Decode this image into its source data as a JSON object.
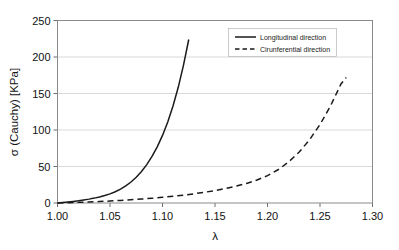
{
  "chart_data": {
    "type": "line",
    "title": "",
    "xlabel": "λ",
    "ylabel": "σ (Cauchy) [KPa]",
    "xlim": [
      1.0,
      1.3
    ],
    "ylim": [
      0,
      250
    ],
    "xticks": [
      "1.00",
      "1.05",
      "1.10",
      "1.15",
      "1.20",
      "1.25",
      "1.30"
    ],
    "xtick_values": [
      1.0,
      1.05,
      1.1,
      1.15,
      1.2,
      1.25,
      1.3
    ],
    "yticks": [
      "0",
      "50",
      "100",
      "150",
      "200",
      "250"
    ],
    "ytick_values": [
      0,
      50,
      100,
      150,
      200,
      250
    ],
    "grid": "horizontal",
    "legend_position": "upper-center-right",
    "series": [
      {
        "name": "Longitudinal direction",
        "style": "solid",
        "color": "#1a1a1a",
        "x": [
          1.0,
          1.005,
          1.01,
          1.015,
          1.02,
          1.025,
          1.03,
          1.035,
          1.04,
          1.045,
          1.05,
          1.055,
          1.06,
          1.065,
          1.07,
          1.075,
          1.08,
          1.085,
          1.09,
          1.095,
          1.1,
          1.105,
          1.11,
          1.115,
          1.12,
          1.125
        ],
        "y": [
          0,
          0.6,
          1.3,
          2.1,
          3.0,
          4.1,
          5.3,
          6.7,
          8.3,
          10.2,
          12.5,
          15.4,
          19.0,
          23.4,
          28.8,
          35.3,
          43.2,
          52.6,
          63.8,
          77.0,
          92.6,
          111.0,
          132.8,
          158.5,
          188.8,
          224.0
        ]
      },
      {
        "name": "Cirunferential direction",
        "style": "dashed",
        "color": "#1a1a1a",
        "x": [
          1.0,
          1.01,
          1.02,
          1.03,
          1.04,
          1.05,
          1.06,
          1.07,
          1.08,
          1.09,
          1.1,
          1.11,
          1.12,
          1.13,
          1.14,
          1.15,
          1.16,
          1.17,
          1.18,
          1.19,
          1.2,
          1.21,
          1.22,
          1.23,
          1.24,
          1.25,
          1.26,
          1.27,
          1.275
        ],
        "y": [
          0,
          0.4,
          0.9,
          1.4,
          2.0,
          2.7,
          3.5,
          4.4,
          5.4,
          6.5,
          7.8,
          9.2,
          10.8,
          12.6,
          14.7,
          17.0,
          19.8,
          23.0,
          26.8,
          31.5,
          37.5,
          45.5,
          56.0,
          69.5,
          86.5,
          107.5,
          133.0,
          163.0,
          172.0
        ]
      }
    ]
  },
  "legend": {
    "entries": [
      {
        "label": "Longitudinal direction",
        "style": "solid"
      },
      {
        "label": "Cirunferential direction",
        "style": "dashed"
      }
    ]
  },
  "colors": {
    "background": "#ffffff",
    "frame": "#8a8a8a",
    "grid": "#c9c9c9",
    "series": "#1a1a1a",
    "text": "#111111"
  }
}
